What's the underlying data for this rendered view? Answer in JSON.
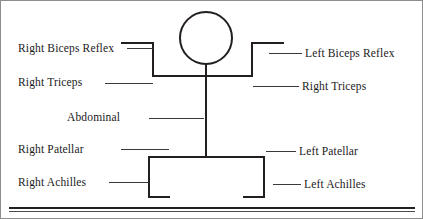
{
  "figure": {
    "title_present": false,
    "type": "reflex-stick-figure-diagram",
    "head_shape": "circle"
  },
  "labels": {
    "left": [
      {
        "id": "right-biceps-reflex",
        "text": "Right Biceps Reflex"
      },
      {
        "id": "right-triceps",
        "text": "Right Triceps"
      },
      {
        "id": "abdominal",
        "text": "Abdominal"
      },
      {
        "id": "right-patellar",
        "text": "Right Patellar"
      },
      {
        "id": "right-achilles",
        "text": "Right Achilles"
      }
    ],
    "right": [
      {
        "id": "left-biceps-reflex",
        "text": "Left Biceps Reflex"
      },
      {
        "id": "right-triceps-right",
        "text": "Right Triceps"
      },
      {
        "id": "left-patellar",
        "text": "Left Patellar"
      },
      {
        "id": "left-achilles",
        "text": "Left Achilles"
      }
    ]
  },
  "colors": {
    "ink": "#231f20",
    "leader": "#3a3a3a",
    "background": "#ffffff",
    "frame": "#8d8d8d"
  }
}
